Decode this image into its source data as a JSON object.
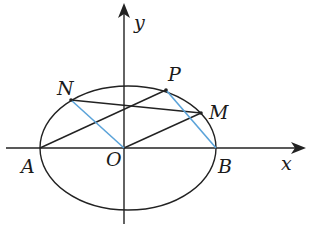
{
  "diagram": {
    "type": "ellipse-geometry",
    "colors": {
      "line": "#222222",
      "highlight": "#5ba3d9",
      "background": "#ffffff"
    },
    "axes": {
      "x_label": "x",
      "y_label": "y",
      "origin_label": "O"
    },
    "points": [
      {
        "name": "A",
        "label": "A"
      },
      {
        "name": "B",
        "label": "B"
      },
      {
        "name": "O",
        "label": "O"
      },
      {
        "name": "N",
        "label": "N"
      },
      {
        "name": "P",
        "label": "P"
      },
      {
        "name": "M",
        "label": "M"
      }
    ],
    "segments": [
      {
        "from": "A",
        "to": "P",
        "color": "black"
      },
      {
        "from": "O",
        "to": "M",
        "color": "black"
      },
      {
        "from": "N",
        "to": "M",
        "color": "black"
      },
      {
        "from": "N",
        "to": "O",
        "color": "blue"
      },
      {
        "from": "P",
        "to": "B",
        "color": "blue"
      }
    ]
  }
}
